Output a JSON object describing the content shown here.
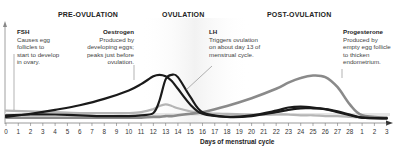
{
  "chart_data": {
    "type": "line",
    "title": "",
    "xlabel": "Days of menstrual cycle",
    "ylabel": "",
    "x_ticks": [
      "0",
      "1",
      "2",
      "3",
      "4",
      "5",
      "6",
      "7",
      "8",
      "9",
      "10",
      "11",
      "12",
      "13",
      "14",
      "15",
      "16",
      "17",
      "18",
      "19",
      "20",
      "21",
      "22",
      "23",
      "24",
      "25",
      "26",
      "27",
      "28",
      "1",
      "2",
      "3"
    ],
    "x": [
      0,
      2,
      4,
      6,
      8,
      10,
      11,
      12,
      12.5,
      13,
      13.5,
      14,
      15,
      16,
      18,
      20,
      22,
      23,
      24,
      25,
      26,
      27,
      28,
      29,
      31
    ],
    "series": [
      {
        "name": "FSH",
        "color": "#b5b5b5",
        "values": [
          12,
          11,
          10,
          9,
          9,
          9,
          10,
          14,
          18,
          20,
          18,
          15,
          11,
          9,
          8,
          7,
          7,
          7,
          6,
          6,
          5,
          5,
          4,
          3,
          3
        ]
      },
      {
        "name": "Oestrogen",
        "color": "#1a1a1a",
        "values": [
          4,
          8,
          13,
          19,
          27,
          38,
          46,
          56,
          58,
          56,
          50,
          40,
          20,
          8,
          4,
          6,
          12,
          16,
          17,
          16,
          14,
          10,
          6,
          3,
          2
        ]
      },
      {
        "name": "LH",
        "color": "#1a1a1a",
        "values": [
          6,
          7,
          7,
          6,
          5,
          5,
          6,
          9,
          25,
          52,
          58,
          55,
          30,
          10,
          4,
          5,
          10,
          13,
          15,
          15,
          14,
          11,
          7,
          3,
          2
        ]
      },
      {
        "name": "Progesterone",
        "color": "#8a8a8a",
        "values": [
          3,
          3,
          3,
          3,
          3,
          3,
          3,
          4,
          4,
          5,
          5,
          6,
          8,
          10,
          18,
          28,
          40,
          48,
          54,
          57,
          55,
          42,
          20,
          6,
          3
        ]
      }
    ],
    "annotations": [
      {
        "label": "PRE-OVULATION",
        "position": "top"
      },
      {
        "label": "OVULATION",
        "position": "top"
      },
      {
        "label": "POST-OVULATION",
        "position": "top"
      }
    ],
    "grid": false,
    "legend": "inline annotations"
  },
  "phases": {
    "pre": "PRE-OVULATION",
    "ovu": "OVULATION",
    "post": "POST-OVULATION"
  },
  "notes": {
    "fsh": {
      "title": "FSH",
      "lines": [
        "Causes egg",
        "follicles to",
        "start to develop",
        "in ovary."
      ]
    },
    "oestrogen": {
      "title": "Oestrogen",
      "lines": [
        "Produced by",
        "developing eggs;",
        "peaks just before",
        "ovulation."
      ]
    },
    "lh": {
      "title": "LH",
      "lines": [
        "Triggers ovulation",
        "on about day 13 of",
        "menstrual cycle."
      ]
    },
    "progesterone": {
      "title": "Progesterone",
      "lines": [
        "Produced by",
        "empty egg follicle",
        "to thicken",
        "endometrium."
      ]
    }
  },
  "axis": {
    "xlabel": "Days of menstrual cycle"
  }
}
